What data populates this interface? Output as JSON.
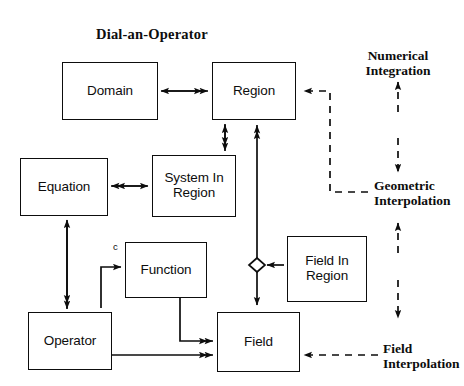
{
  "title": "Dial-an-Operator",
  "nodes": [
    {
      "id": "domain",
      "label": "Domain",
      "x": 62,
      "y": 62,
      "w": 96,
      "h": 58
    },
    {
      "id": "region",
      "label": "Region",
      "x": 212,
      "y": 62,
      "w": 84,
      "h": 58
    },
    {
      "id": "equation",
      "label": "Equation",
      "x": 20,
      "y": 158,
      "w": 88,
      "h": 58
    },
    {
      "id": "system_in_region",
      "label": "System In Region",
      "x": 152,
      "y": 155,
      "w": 84,
      "h": 62
    },
    {
      "id": "function",
      "label": "Function",
      "x": 125,
      "y": 242,
      "w": 82,
      "h": 56
    },
    {
      "id": "field_in_region",
      "label": "Field In Region",
      "x": 287,
      "y": 236,
      "w": 80,
      "h": 66
    },
    {
      "id": "operator",
      "label": "Operator",
      "x": 28,
      "y": 312,
      "w": 84,
      "h": 58
    },
    {
      "id": "field",
      "label": "Field",
      "x": 217,
      "y": 312,
      "w": 83,
      "h": 60
    }
  ],
  "annotations": [
    {
      "id": "numerical_integration",
      "line1": "Numerical",
      "line2": "Integration"
    },
    {
      "id": "geometric_interpolation",
      "line1": "Geometric",
      "line2": "Interpolation"
    },
    {
      "id": "field_interpolation",
      "line1": "Field",
      "line2": "Interpolation"
    }
  ],
  "edge_labels": [
    {
      "id": "function_input_c",
      "text": "c"
    }
  ],
  "colors": {
    "ink": "#0d0d0d",
    "background": "#ffffff"
  }
}
